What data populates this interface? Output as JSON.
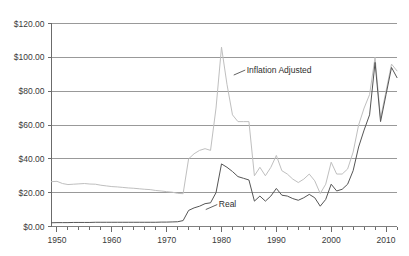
{
  "chart_data": {
    "type": "line",
    "title": "",
    "xlabel": "",
    "ylabel": "",
    "xlim": [
      1949,
      2012
    ],
    "ylim": [
      0,
      120
    ],
    "grid": true,
    "legend_position": "inline-annotation",
    "y_tick_labels": [
      "$120.00",
      "$100.00",
      "$80.00",
      "$60.00",
      "$40.00",
      "$20.00",
      "$0.00"
    ],
    "y_tick_values": [
      120,
      100,
      80,
      60,
      40,
      20,
      0
    ],
    "x_tick_labels": [
      "1950",
      "1960",
      "1970",
      "1980",
      "1990",
      "2000",
      "2010"
    ],
    "x_tick_values": [
      1950,
      1960,
      1970,
      1980,
      1990,
      2000,
      2010
    ],
    "x_minor_tick_step": 2,
    "colors": {
      "inflation_adjusted": "#bfbfbf",
      "real": "#555555",
      "grid": "#808080",
      "axis": "#6b6b6b",
      "text": "#3a3a3a"
    },
    "annotations": [
      {
        "name": "inflation-adjusted-label",
        "text": "Inflation Adjusted",
        "x": 1984.6,
        "y": 91
      },
      {
        "name": "real-label",
        "text": "Real",
        "x": 1979.5,
        "y": 11.5
      }
    ],
    "series": [
      {
        "name": "Inflation Adjusted",
        "color": "#bfbfbf",
        "x": [
          1949,
          1950,
          1951,
          1952,
          1953,
          1954,
          1955,
          1956,
          1957,
          1958,
          1959,
          1960,
          1961,
          1962,
          1963,
          1964,
          1965,
          1966,
          1967,
          1968,
          1969,
          1970,
          1971,
          1972,
          1973,
          1974,
          1975,
          1976,
          1977,
          1978,
          1979,
          1980,
          1981,
          1982,
          1983,
          1984,
          1985,
          1986,
          1987,
          1988,
          1989,
          1990,
          1991,
          1992,
          1993,
          1994,
          1995,
          1996,
          1997,
          1998,
          1999,
          2000,
          2001,
          2002,
          2003,
          2004,
          2005,
          2006,
          2007,
          2008,
          2009,
          2010,
          2011,
          2012
        ],
        "values": [
          26.5,
          26.7,
          25.4,
          24.8,
          25.0,
          25.2,
          25.4,
          25.1,
          25.0,
          24.4,
          24.0,
          23.6,
          23.4,
          23.1,
          22.8,
          22.6,
          22.3,
          22.0,
          21.8,
          21.3,
          21.0,
          20.6,
          20.3,
          19.6,
          19.4,
          40.0,
          43.0,
          45.0,
          46.0,
          45.0,
          70.0,
          106.0,
          84.0,
          66.0,
          62.0,
          62.0,
          62.0,
          30.0,
          35.0,
          30.0,
          35.0,
          42.0,
          33.0,
          31.0,
          28.0,
          26.0,
          28.0,
          31.0,
          27.0,
          19.5,
          25.0,
          38.0,
          31.0,
          31.0,
          34.0,
          44.0,
          60.0,
          70.0,
          78.0,
          100.0,
          64.0,
          80.0,
          96.0,
          92.0
        ]
      },
      {
        "name": "Real",
        "color": "#555555",
        "x": [
          1949,
          1950,
          1951,
          1952,
          1953,
          1954,
          1955,
          1956,
          1957,
          1958,
          1959,
          1960,
          1961,
          1962,
          1963,
          1964,
          1965,
          1966,
          1967,
          1968,
          1969,
          1970,
          1971,
          1972,
          1973,
          1974,
          1975,
          1976,
          1977,
          1978,
          1979,
          1980,
          1981,
          1982,
          1983,
          1984,
          1985,
          1986,
          1987,
          1988,
          1989,
          1990,
          1991,
          1992,
          1993,
          1994,
          1995,
          1996,
          1997,
          1998,
          1999,
          2000,
          2001,
          2002,
          2003,
          2004,
          2005,
          2006,
          2007,
          2008,
          2009,
          2010,
          2011,
          2012
        ],
        "values": [
          2.2,
          2.3,
          2.3,
          2.3,
          2.4,
          2.4,
          2.4,
          2.4,
          2.5,
          2.5,
          2.5,
          2.5,
          2.5,
          2.5,
          2.5,
          2.5,
          2.5,
          2.5,
          2.5,
          2.5,
          2.6,
          2.6,
          2.7,
          2.8,
          3.5,
          9.5,
          11.0,
          12.0,
          13.5,
          14.0,
          20.0,
          37.0,
          35.0,
          32.5,
          29.5,
          28.5,
          27.5,
          15.0,
          18.0,
          15.0,
          18.0,
          22.5,
          18.5,
          18.0,
          16.5,
          15.5,
          17.0,
          19.0,
          17.0,
          12.0,
          16.0,
          25.0,
          21.0,
          22.0,
          25.0,
          33.0,
          47.0,
          57.0,
          66.0,
          97.0,
          62.0,
          78.0,
          94.0,
          88.0
        ]
      }
    ]
  }
}
